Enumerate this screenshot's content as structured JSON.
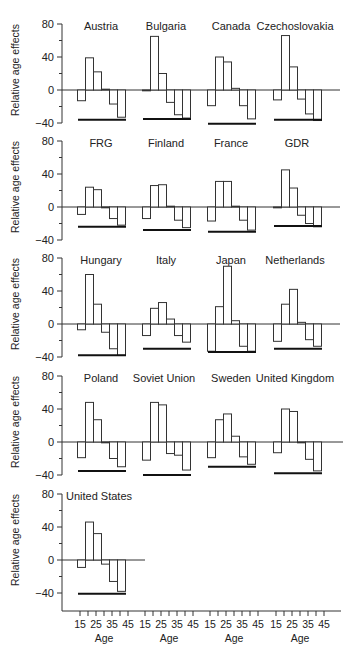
{
  "chart_data": {
    "type": "bar",
    "title": "",
    "xlabel": "Age",
    "ylabel": "Relative age effects",
    "ylim": [
      -40,
      80
    ],
    "y_ticks": [
      80,
      40,
      0,
      -40
    ],
    "x_tick_labels": [
      "15",
      "25",
      "35",
      "45"
    ],
    "categories": [
      "15-19",
      "20-24",
      "25-29",
      "30-34",
      "35-39",
      "40-44"
    ],
    "grid": false,
    "legend": null,
    "panels": [
      {
        "name": "Austria",
        "values": [
          -13,
          39,
          22,
          1,
          -17,
          -33
        ],
        "ref_line": -36
      },
      {
        "name": "Bulgaria",
        "values": [
          -1,
          65,
          20,
          -15,
          -30,
          -34
        ],
        "ref_line": -35
      },
      {
        "name": "Canada",
        "values": [
          -19,
          40,
          34,
          2,
          -19,
          -35
        ],
        "ref_line": -41
      },
      {
        "name": "Czechoslovakia",
        "values": [
          -12,
          66,
          28,
          -11,
          -29,
          -37
        ],
        "ref_line": -36
      },
      {
        "name": "FRG",
        "values": [
          -9,
          24,
          21,
          -1,
          -14,
          -22
        ],
        "ref_line": -24
      },
      {
        "name": "Finland",
        "values": [
          -14,
          26,
          27,
          1,
          -16,
          -25
        ],
        "ref_line": -28
      },
      {
        "name": "France",
        "values": [
          -17,
          31,
          31,
          1,
          -16,
          -28
        ],
        "ref_line": -30
      },
      {
        "name": "GDR",
        "values": [
          -1,
          45,
          23,
          -10,
          -20,
          -24
        ],
        "ref_line": -23
      },
      {
        "name": "Hungary",
        "values": [
          -7,
          60,
          24,
          -10,
          -30,
          -38
        ],
        "ref_line": -38
      },
      {
        "name": "Italy",
        "values": [
          -14,
          19,
          26,
          6,
          -14,
          -22
        ],
        "ref_line": -30
      },
      {
        "name": "Japan",
        "values": [
          -33,
          21,
          70,
          4,
          -27,
          -33
        ],
        "ref_line": -34
      },
      {
        "name": "Netherlands",
        "values": [
          -21,
          24,
          42,
          2,
          -19,
          -27
        ],
        "ref_line": -30
      },
      {
        "name": "Poland",
        "values": [
          -19,
          48,
          27,
          -1,
          -20,
          -30
        ],
        "ref_line": -35
      },
      {
        "name": "Soviet Union",
        "values": [
          -22,
          48,
          45,
          -14,
          -16,
          -34
        ],
        "ref_line": -40
      },
      {
        "name": "Sweden",
        "values": [
          -19,
          27,
          34,
          7,
          -18,
          -27
        ],
        "ref_line": -30
      },
      {
        "name": "United Kingdom",
        "values": [
          -13,
          40,
          37,
          -1,
          -21,
          -35
        ],
        "ref_line": -38
      },
      {
        "name": "United States",
        "values": [
          -9,
          46,
          32,
          -5,
          -26,
          -38
        ],
        "ref_line": -41
      }
    ],
    "layout": {
      "rows": 5,
      "cols": 4
    }
  }
}
